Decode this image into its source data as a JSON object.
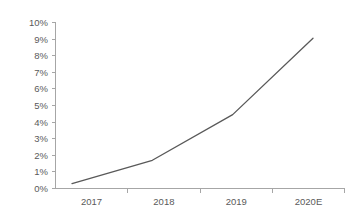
{
  "chart_data": {
    "type": "line",
    "title": "",
    "subtitle": "",
    "xlabel": "",
    "ylabel": "",
    "categories": [
      "2017",
      "2018",
      "2019",
      "2020E"
    ],
    "series": [
      {
        "name": "",
        "values": [
          0.3,
          1.7,
          4.45,
          9.05
        ]
      }
    ],
    "ylim": [
      0,
      10
    ],
    "ytick_values": [
      0,
      1,
      2,
      3,
      4,
      5,
      6,
      7,
      8,
      9,
      10
    ],
    "ytick_labels": [
      "0%",
      "1%",
      "2%",
      "3%",
      "4%",
      "5%",
      "6%",
      "7%",
      "8%",
      "9%",
      "10%"
    ],
    "xtick_labels": [
      "2017",
      "2018",
      "2019",
      "2020E"
    ],
    "grid": false,
    "legend": null,
    "legend_position": "none",
    "colors": {
      "line": "#595959",
      "axis": "#a6a6a6",
      "tick_text": "#5a5a5a",
      "background": "#ffffff"
    },
    "annotations": []
  },
  "axis": {
    "y_labels": {
      "t10": "10%",
      "t9": "9%",
      "t8": "8%",
      "t7": "7%",
      "t6": "6%",
      "t5": "5%",
      "t4": "4%",
      "t3": "3%",
      "t2": "2%",
      "t1": "1%",
      "t0": "0%"
    },
    "x_labels": {
      "c0": "2017",
      "c1": "2018",
      "c2": "2019",
      "c3": "2020E"
    }
  }
}
